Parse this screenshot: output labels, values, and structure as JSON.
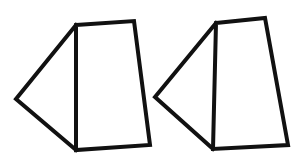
{
  "diagram": {
    "stroke_color": "#111111",
    "background_color": "#ffffff",
    "figures": [
      {
        "name": "figure-1",
        "parts": [
          "triangle",
          "quadrilateral"
        ]
      },
      {
        "name": "figure-2",
        "parts": [
          "triangle",
          "quadrilateral"
        ]
      }
    ]
  }
}
